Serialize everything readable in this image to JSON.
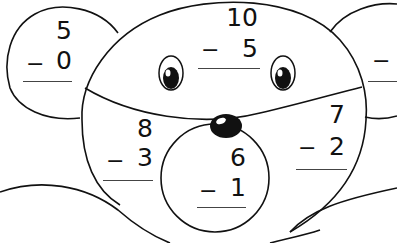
{
  "worksheet": {
    "title": "Subtraction Mouse Face",
    "problems": [
      {
        "id": "left-ear",
        "top": "5",
        "operator": "−",
        "bottom": "0"
      },
      {
        "id": "forehead",
        "top": "10",
        "operator": "−",
        "bottom": "5"
      },
      {
        "id": "left-cheek",
        "top": "8",
        "operator": "−",
        "bottom": "3"
      },
      {
        "id": "snout",
        "top": "6",
        "operator": "−",
        "bottom": "1"
      },
      {
        "id": "right-cheek",
        "top": "7",
        "operator": "−",
        "bottom": "2"
      },
      {
        "id": "right-ear",
        "top": "",
        "operator": "−",
        "bottom": ""
      }
    ]
  },
  "colors": {
    "ink": "#111111",
    "paper": "#ffffff"
  }
}
